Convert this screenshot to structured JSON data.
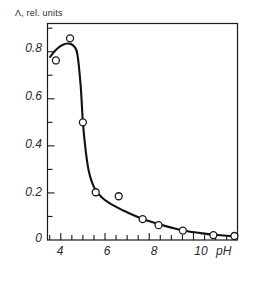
{
  "chart_data": {
    "type": "scatter",
    "title": "",
    "ylabel": "Λ, rel. units",
    "xlabel": "pH",
    "xlim": [
      3.4,
      11.99
    ],
    "ylim": [
      0.0,
      0.92
    ],
    "grid": false,
    "legend": null,
    "x_ticks_major": [
      4,
      6,
      8,
      10
    ],
    "x_tick_labels": [
      "4",
      "6",
      "8",
      "10"
    ],
    "x_ticks_minor": [
      3.5,
      4.5,
      5,
      5.5,
      6.5,
      7,
      7.5,
      8.5,
      9,
      9.5,
      10.5,
      11,
      11.5
    ],
    "y_ticks_major": [
      0,
      0.2,
      0.4,
      0.6,
      0.8
    ],
    "y_tick_labels": [
      "0",
      "0.2",
      "0.4",
      "0.6",
      "0.8"
    ],
    "y_ticks_minor": [
      0.1,
      0.3,
      0.5,
      0.7,
      0.9
    ],
    "series": [
      {
        "name": "measured points",
        "marker": "open-circle",
        "x": [
          3.78,
          4.42,
          5.0,
          5.58,
          6.62,
          7.7,
          8.42,
          9.52,
          10.9,
          11.85
        ],
        "values": [
          0.763,
          0.857,
          0.5,
          0.203,
          0.186,
          0.089,
          0.063,
          0.04,
          0.021,
          0.017
        ]
      },
      {
        "name": "fitted curve",
        "marker": "none",
        "x": [
          3.52,
          3.7,
          3.9,
          4.1,
          4.3,
          4.45,
          4.6,
          4.75,
          4.9,
          5.0,
          5.12,
          5.25,
          5.4,
          5.6,
          5.85,
          6.1,
          6.4,
          6.7,
          7.0,
          7.4,
          7.8,
          8.2,
          8.7,
          9.2,
          9.8,
          10.4,
          11.0,
          11.5,
          11.95
        ],
        "values": [
          0.778,
          0.8,
          0.818,
          0.83,
          0.835,
          0.833,
          0.823,
          0.79,
          0.655,
          0.5,
          0.385,
          0.3,
          0.248,
          0.208,
          0.182,
          0.163,
          0.146,
          0.131,
          0.118,
          0.101,
          0.086,
          0.074,
          0.06,
          0.048,
          0.036,
          0.028,
          0.022,
          0.018,
          0.015
        ]
      }
    ]
  },
  "colors": {
    "axis": "#1a1a1a",
    "curve": "#111111",
    "marker_stroke": "#1a1a1a",
    "marker_fill": "#ffffff",
    "background": "#ffffff",
    "text": "#2b2b2b"
  }
}
